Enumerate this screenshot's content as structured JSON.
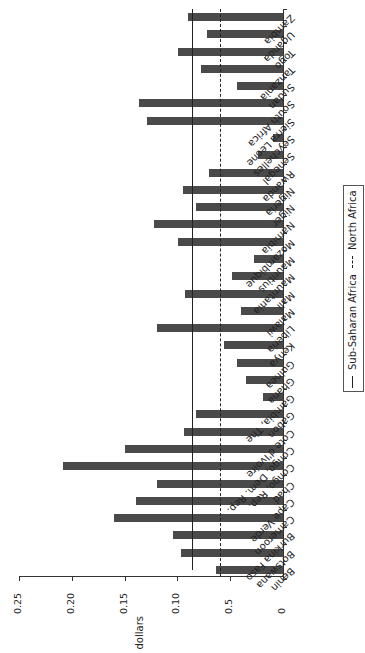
{
  "chart_data": {
    "type": "bar",
    "orientation": "horizontal bars (figure rotated 90°)",
    "title": "",
    "xlabel": "",
    "ylabel": "dollars",
    "ylim": [
      0,
      0.25
    ],
    "yticks": [
      "0",
      "0.5",
      "0.10",
      "0.15",
      "0.20",
      "0.25"
    ],
    "categories": [
      "Benin",
      "Botswana",
      "Burkina Faso",
      "Cameroon",
      "Cape Verde",
      "Chad",
      "Congo, Rep.",
      "Congo, Dem. Rep.",
      "Cote d'Ivoire",
      "Gabon",
      "Gambia, The",
      "Ghana",
      "Guinea",
      "Kenya",
      "Liberia",
      "Malawi",
      "Mali",
      "Mauritania",
      "Mauritius",
      "Mozambique",
      "Namibia",
      "Niger",
      "Nigeria",
      "Rwanda",
      "Senegal",
      "Seychelles",
      "Sierra Leone",
      "South Africa",
      "Sudan",
      "Tanzania",
      "Togo",
      "Uganda",
      "Zambia"
    ],
    "values": [
      0.063,
      0.097,
      0.104,
      0.16,
      0.139,
      0.119,
      0.208,
      0.15,
      0.094,
      0.082,
      0.019,
      0.035,
      0.044,
      0.056,
      0.119,
      0.04,
      0.093,
      0.048,
      0.027,
      0.099,
      0.122,
      0.082,
      0.095,
      0.07,
      0.024,
      0.009,
      0.129,
      0.136,
      0.044,
      0.078,
      0.099,
      0.072,
      0.09
    ],
    "reference_lines": [
      {
        "name": "Sub-Saharan Africa",
        "value": 0.086,
        "style": "solid"
      },
      {
        "name": "North Africa",
        "value": 0.06,
        "style": "dashed"
      }
    ],
    "legend": [
      "Sub-Saharan Africa",
      "North Africa"
    ],
    "legend_position": "right (rotated)",
    "grid": false
  },
  "axis": {
    "title": "dollars",
    "tick_labels": [
      "0",
      "0.5",
      "0.10",
      "0.15",
      "0.20",
      "0.25"
    ]
  },
  "legend": {
    "solid_label": "Sub-Saharan Africa",
    "dashed_label": "North Africa"
  },
  "colors": {
    "bar": "#4a4a4a",
    "lines": "#222222"
  }
}
